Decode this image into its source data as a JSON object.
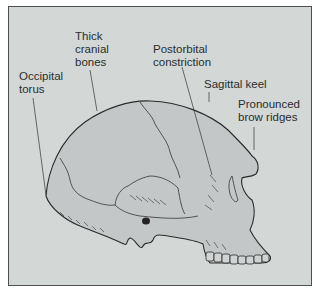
{
  "figure": {
    "colors": {
      "panel_background": "#d3d8d6",
      "skull_fill": "#c4c7c8",
      "line": "#2a2a2a",
      "frame_border": "#4a4f50"
    },
    "labels": [
      {
        "id": "thick-cranial-bones",
        "lines": [
          "Thick",
          "cranial",
          "bones"
        ]
      },
      {
        "id": "occipital-torus",
        "lines": [
          "Occipital",
          "torus"
        ]
      },
      {
        "id": "postorbital-constriction",
        "lines": [
          "Postorbital",
          "constriction"
        ]
      },
      {
        "id": "sagittal-keel",
        "lines": [
          "Sagittal keel"
        ]
      },
      {
        "id": "pronounced-brow-ridges",
        "lines": [
          "Pronounced",
          "brow ridges"
        ]
      }
    ]
  }
}
